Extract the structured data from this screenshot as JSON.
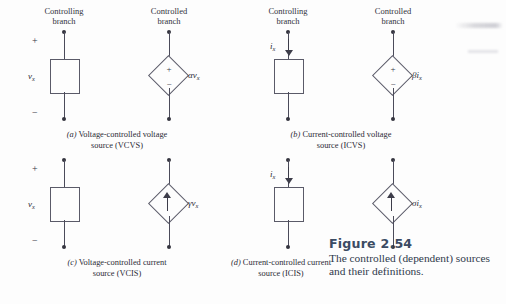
{
  "figure": {
    "title": "Figure  2.54",
    "caption_line1": "The controlled (dependent) sources",
    "caption_line2": "and their definitions.",
    "title_color": "#3b4b63",
    "body_color": "#2f3a4c"
  },
  "headers": {
    "controlling": "Controlling",
    "controlled": "Controlled",
    "branch": "branch"
  },
  "signs": {
    "plus": "+",
    "minus": "−"
  },
  "panels": [
    {
      "id": "a",
      "tag": "(a)",
      "caption_line1": "Voltage-controlled voltage",
      "caption_line2": "source (VCVS)",
      "controlling": {
        "type": "voltage-box",
        "plus": "+",
        "minus": "−",
        "variable": "v",
        "subscript": "x"
      },
      "controlled": {
        "type": "voltage-source-diamond",
        "inner_plus": "+",
        "inner_minus": "−",
        "gain": "α",
        "variable": "v",
        "subscript": "x"
      }
    },
    {
      "id": "b",
      "tag": "(b)",
      "caption_line1": "Current-controlled voltage",
      "caption_line2": "source (ICVS)",
      "controlling": {
        "type": "current-box",
        "variable": "i",
        "subscript": "x"
      },
      "controlled": {
        "type": "voltage-source-diamond",
        "inner_plus": "+",
        "inner_minus": "−",
        "gain": "β",
        "variable": "i",
        "subscript": "x"
      }
    },
    {
      "id": "c",
      "tag": "(c)",
      "caption_line1": "Voltage-controlled current",
      "caption_line2": "source (VCIS)",
      "controlling": {
        "type": "voltage-box",
        "plus": "+",
        "minus": "−",
        "variable": "v",
        "subscript": "x"
      },
      "controlled": {
        "type": "current-source-diamond",
        "gain": "γ",
        "variable": "v",
        "subscript": "x"
      }
    },
    {
      "id": "d",
      "tag": "(d)",
      "caption_line1": "Current-controlled current",
      "caption_line2": "source (ICIS)",
      "controlling": {
        "type": "current-box",
        "variable": "i",
        "subscript": "x"
      },
      "controlled": {
        "type": "current-source-diamond",
        "gain": "σ",
        "variable": "i",
        "subscript": "x"
      }
    }
  ]
}
